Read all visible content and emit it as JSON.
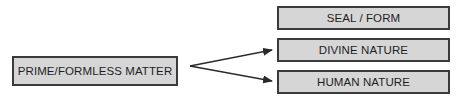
{
  "diagram": {
    "source_node": {
      "label": "PRIME/FORMLESS MATTER"
    },
    "target_nodes": [
      {
        "label": "SEAL / FORM"
      },
      {
        "label": "DIVINE NATURE"
      },
      {
        "label": "HUMAN NATURE"
      }
    ],
    "edges": [
      {
        "from": "PRIME/FORMLESS MATTER",
        "to": "DIVINE NATURE"
      },
      {
        "from": "PRIME/FORMLESS MATTER",
        "to": "HUMAN NATURE"
      }
    ],
    "colors": {
      "box_fill": "#d6d6d6",
      "box_border": "#3a3a3a",
      "text": "#1e1e1e",
      "arrow": "#2a2a2a"
    }
  }
}
